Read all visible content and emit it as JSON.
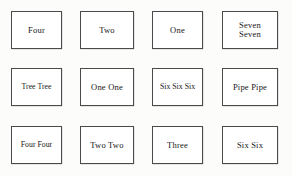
{
  "document": {
    "kind": "scanned-label-grid",
    "background_color": "#fcfcfb",
    "box_fill_color": "#ffffff",
    "box_border_color": "#4a4a4a",
    "text_color": "#171717",
    "rows": 3,
    "columns": 4
  },
  "grid": {
    "rows": [
      {
        "row_label": "row-1",
        "cells": [
          {
            "text": "Four",
            "lines": 1,
            "size": "normal"
          },
          {
            "text": "Two",
            "lines": 1,
            "size": "normal"
          },
          {
            "text": "One",
            "lines": 1,
            "size": "normal"
          },
          {
            "text": "Seven\nSeven",
            "lines": 2,
            "size": "normal"
          }
        ]
      },
      {
        "row_label": "row-2",
        "cells": [
          {
            "text": "Tree Tree",
            "lines": 1,
            "size": "tight"
          },
          {
            "text": "One One",
            "lines": 1,
            "size": "normal"
          },
          {
            "text": "Six Six Six",
            "lines": 1,
            "size": "tight"
          },
          {
            "text": "Pipe Pipe",
            "lines": 1,
            "size": "normal"
          }
        ]
      },
      {
        "row_label": "row-3",
        "cells": [
          {
            "text": "Four Four",
            "lines": 1,
            "size": "tight"
          },
          {
            "text": "Two Two",
            "lines": 1,
            "size": "normal"
          },
          {
            "text": "Three",
            "lines": 1,
            "size": "normal"
          },
          {
            "text": "Six Six",
            "lines": 1,
            "size": "normal"
          }
        ]
      }
    ]
  }
}
